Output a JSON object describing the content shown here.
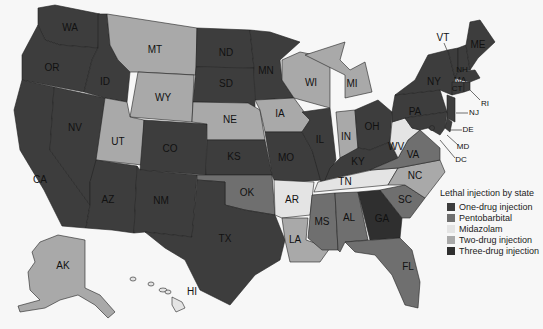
{
  "legend": {
    "title": "Lethal injection by state",
    "items": [
      {
        "key": "one",
        "label": "One-drug injection",
        "color": "#3d3d3d"
      },
      {
        "key": "pento",
        "label": "Pentobarbital",
        "color": "#6f6f6f"
      },
      {
        "key": "mida",
        "label": "Midazolam",
        "color": "#e4e4e4"
      },
      {
        "key": "two",
        "label": "Two-drug injection",
        "color": "#a9a9a9"
      },
      {
        "key": "three",
        "label": "Three-drug injection",
        "color": "#2f2f2f"
      }
    ]
  },
  "states": {
    "WA": "one",
    "OR": "one",
    "CA": "one",
    "NV": "one",
    "ID": "one",
    "MT": "two",
    "WY": "two",
    "UT": "two",
    "AZ": "one",
    "CO": "one",
    "NM": "one",
    "ND": "one",
    "SD": "one",
    "NE": "two",
    "KS": "one",
    "OK": "pento",
    "TX": "one",
    "MN": "one",
    "IA": "two",
    "MO": "one",
    "AR": "mida",
    "LA": "two",
    "WI": "two",
    "IL": "one",
    "MI": "two",
    "IN": "two",
    "OH": "one",
    "KY": "one",
    "TN": "mida",
    "MS": "pento",
    "AL": "pento",
    "GA": "three",
    "FL": "pento",
    "SC": "pento",
    "NC": "two",
    "VA": "pento",
    "WV": "mida",
    "PA": "one",
    "NY": "one",
    "VT": "one",
    "NH": "one",
    "ME": "one",
    "MA": "one",
    "CT": "one",
    "RI": "one",
    "NJ": "one",
    "DE": "one",
    "MD": "one",
    "DC": "one",
    "AK": "two",
    "HI": "mida"
  },
  "labels": {
    "WA": "WA",
    "OR": "OR",
    "CA": "CA",
    "NV": "NV",
    "ID": "ID",
    "MT": "MT",
    "WY": "WY",
    "UT": "UT",
    "AZ": "AZ",
    "CO": "CO",
    "NM": "NM",
    "ND": "ND",
    "SD": "SD",
    "NE": "NE",
    "KS": "KS",
    "OK": "OK",
    "TX": "TX",
    "MN": "MN",
    "IA": "IA",
    "MO": "MO",
    "AR": "AR",
    "LA": "LA",
    "WI": "WI",
    "IL": "IL",
    "MI": "MI",
    "IN": "IN",
    "OH": "OH",
    "KY": "KY",
    "TN": "TN",
    "MS": "MS",
    "AL": "AL",
    "GA": "GA",
    "FL": "FL",
    "SC": "SC",
    "NC": "NC",
    "VA": "VA",
    "WV": "WV",
    "PA": "PA",
    "NY": "NY",
    "VT": "VT",
    "NH": "NH",
    "ME": "ME",
    "MA": "MA",
    "CT": "CT",
    "RI": "RI",
    "NJ": "NJ",
    "DE": "DE",
    "MD": "MD",
    "DC": "DC",
    "AK": "AK",
    "HI": "HI"
  }
}
